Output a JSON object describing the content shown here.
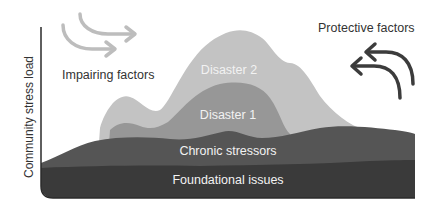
{
  "diagram": {
    "y_axis_label": "Community stress load",
    "left_caption": "Impairing factors",
    "right_caption": "Protective factors",
    "layers": [
      {
        "name": "Foundational issues",
        "color": "#3a3a3a"
      },
      {
        "name": "Chronic stressors",
        "color": "#555555"
      },
      {
        "name": "Disaster 1",
        "color": "#979797"
      },
      {
        "name": "Disaster 2",
        "color": "#c3c3c3"
      }
    ],
    "arrows": {
      "impairing": {
        "direction": "right",
        "color": "#bdbdbd",
        "count": 2
      },
      "protective": {
        "direction": "left",
        "color": "#3c3c3c",
        "count": 2
      }
    }
  }
}
